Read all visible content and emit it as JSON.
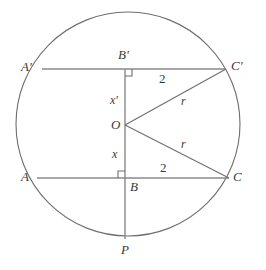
{
  "figure": {
    "type": "geometry-diagram",
    "colors": {
      "stroke": "#6e6e6e",
      "label": "#3a3a3a",
      "background": "#ffffff"
    }
  },
  "circle": {
    "name": "main-circle",
    "center_x": 128,
    "center_y": 124,
    "radius": 112
  },
  "vertical_line": {
    "name": "vertical-diameter",
    "x": 125,
    "y_top": 69,
    "y_bottom": 239
  },
  "chords": [
    {
      "name": "upper-chord",
      "label": "A'C'",
      "x1": 42,
      "y1": 69,
      "x2": 226,
      "y2": 69
    },
    {
      "name": "lower-chord",
      "label": "AC",
      "x1": 37,
      "y1": 178,
      "x2": 229,
      "y2": 178
    }
  ],
  "radii": [
    {
      "name": "radius-to-c-prime",
      "x1": 125,
      "y1": 125,
      "x2": 226,
      "y2": 69,
      "label": "r"
    },
    {
      "name": "radius-to-c",
      "x1": 125,
      "y1": 125,
      "x2": 229,
      "y2": 178,
      "label": "r"
    }
  ],
  "right_angles": [
    {
      "name": "right-angle-at-b-prime",
      "x": 125,
      "y": 69,
      "size": 7,
      "dx": 1,
      "dy": 1
    },
    {
      "name": "right-angle-at-b",
      "x": 125,
      "y": 178,
      "size": 7,
      "dx": -1,
      "dy": -1
    }
  ],
  "labels": {
    "a_prime": "A'",
    "b_prime": "B'",
    "c_prime": "C'",
    "a": "A",
    "b": "B",
    "c": "C",
    "o": "O",
    "p": "P",
    "x_prime": "x'",
    "x": "x",
    "r_upper": "r",
    "r_lower": "r",
    "two_upper": "2",
    "two_lower": "2"
  }
}
